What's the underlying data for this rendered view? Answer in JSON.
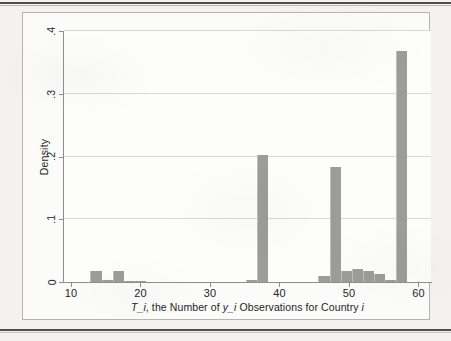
{
  "figure": {
    "axis_color": "#8e8e8c",
    "grid_color": "#d8d8d6",
    "bar_color": "#9c9c9a",
    "page_color": "#f3f2f0",
    "plot_color": "#fdfdfc"
  },
  "chart_data": {
    "type": "bar",
    "title": "",
    "subtitle": "",
    "xlabel": "T_i, the Number of y_i Observations for Country i",
    "xlabel_parts": [
      {
        "text": "T_i",
        "italic": true
      },
      {
        "text": ", the Number of ",
        "italic": false
      },
      {
        "text": "y_i",
        "italic": true
      },
      {
        "text": " Observations for Country ",
        "italic": false
      },
      {
        "text": "i",
        "italic": true
      }
    ],
    "ylabel": "Density",
    "xlim": [
      9.0,
      61.8
    ],
    "ylim": [
      0,
      0.4
    ],
    "xticks": [
      10,
      20,
      30,
      40,
      50,
      60
    ],
    "xticklabels": [
      "10",
      "20",
      "30",
      "40",
      "50",
      "60"
    ],
    "yticks": [
      0,
      0.1,
      0.2,
      0.3,
      0.4
    ],
    "yticklabels": [
      "0",
      ".1",
      ".2",
      ".3",
      ".4"
    ],
    "grid": "horizontal",
    "legend": "none",
    "bin_width": 1.6,
    "bars": [
      {
        "x_left": 12.8,
        "x_center": 13.6,
        "value": 0.017
      },
      {
        "x_left": 14.4,
        "x_center": 15.2,
        "value": 0.003
      },
      {
        "x_left": 16.0,
        "x_center": 16.8,
        "value": 0.017
      },
      {
        "x_left": 17.6,
        "x_center": 18.4,
        "value": 0.002
      },
      {
        "x_left": 19.2,
        "x_center": 20.0,
        "value": 0.002
      },
      {
        "x_left": 35.2,
        "x_center": 36.0,
        "value": 0.004
      },
      {
        "x_left": 36.8,
        "x_center": 37.6,
        "value": 0.202
      },
      {
        "x_left": 45.6,
        "x_center": 46.4,
        "value": 0.01
      },
      {
        "x_left": 47.2,
        "x_center": 48.0,
        "value": 0.183
      },
      {
        "x_left": 48.8,
        "x_center": 49.6,
        "value": 0.018
      },
      {
        "x_left": 50.4,
        "x_center": 51.2,
        "value": 0.02
      },
      {
        "x_left": 52.0,
        "x_center": 52.8,
        "value": 0.017
      },
      {
        "x_left": 53.6,
        "x_center": 54.4,
        "value": 0.012
      },
      {
        "x_left": 55.2,
        "x_center": 56.0,
        "value": 0.004
      },
      {
        "x_left": 56.8,
        "x_center": 57.6,
        "value": 0.368
      }
    ]
  }
}
